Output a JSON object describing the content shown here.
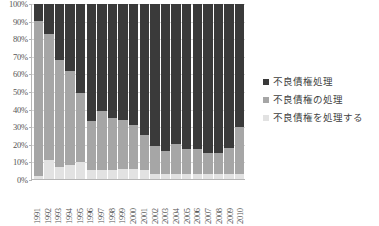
{
  "chart_data": {
    "type": "bar",
    "stacked": true,
    "normalized": true,
    "title": "",
    "xlabel": "",
    "ylabel": "",
    "ylim": [
      0,
      100
    ],
    "ytick_labels": [
      "100%",
      "90%",
      "80%",
      "70%",
      "60%",
      "50%",
      "40%",
      "30%",
      "20%",
      "10%",
      "0%"
    ],
    "ytick_values": [
      100,
      90,
      80,
      70,
      60,
      50,
      40,
      30,
      20,
      10,
      0
    ],
    "grid": true,
    "legend_position": "right",
    "categories": [
      "1991",
      "1992",
      "1993",
      "1994",
      "1995",
      "1996",
      "1997",
      "1998",
      "1999",
      "2000",
      "2001",
      "2002",
      "2003",
      "2004",
      "2005",
      "2006",
      "2007",
      "2008",
      "2009",
      "2010"
    ],
    "series": [
      {
        "name": "不良債権を処理する",
        "color": "#e2e2e2",
        "values": [
          2,
          11,
          7,
          8,
          10,
          5,
          5,
          5,
          6,
          6,
          5,
          3,
          3,
          3,
          3,
          3,
          3,
          3,
          3,
          3
        ]
      },
      {
        "name": "不良債権の処理",
        "color": "#a6a6a6",
        "values": [
          88,
          72,
          61,
          54,
          39,
          28,
          34,
          30,
          28,
          25,
          20,
          16,
          13,
          17,
          14,
          14,
          12,
          12,
          15,
          27
        ]
      },
      {
        "name": "不良債権処理",
        "color": "#3a3a3a",
        "values": [
          10,
          17,
          32,
          38,
          51,
          67,
          61,
          65,
          66,
          69,
          75,
          81,
          84,
          80,
          83,
          83,
          85,
          85,
          82,
          70
        ]
      }
    ]
  },
  "legend": {
    "items": [
      {
        "label": "不良債権処理",
        "color": "#3a3a3a"
      },
      {
        "label": "不良債権の処理",
        "color": "#a6a6a6"
      },
      {
        "label": "不良債権を処理する",
        "color": "#e2e2e2"
      }
    ]
  }
}
